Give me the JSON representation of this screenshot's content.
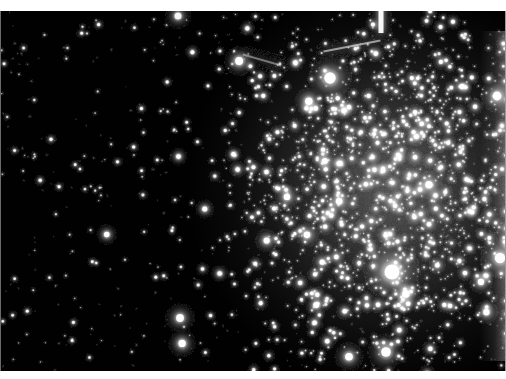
{
  "image": {
    "kind": "astronomical-photograph",
    "subject": "globular star cluster",
    "palette": "grayscale",
    "width": 506,
    "height": 379,
    "alt": "Grayscale astronomical image of a dense globular star cluster filling the right half of the frame against a sparse black star field on the left"
  },
  "frame": {
    "background_color": "#ffffff",
    "band_top_height": 11,
    "band_bottom_height": 8,
    "plate_top": 11,
    "plate_height": 360,
    "plate_background_color": "#010101",
    "edge_left_color": "#6a6a6a",
    "edge_right_color": "#9a9a9a"
  },
  "chart_data": {
    "type": "scatter",
    "title": "",
    "xlabel": "",
    "ylabel": "",
    "grid": false,
    "legend": null,
    "xlim": [
      0,
      506
    ],
    "ylim": [
      0,
      360
    ],
    "background": "#010101",
    "cluster": {
      "center_x": 392,
      "center_y": 176,
      "core_radius": 96,
      "halo_radius": 205,
      "peak_surface_brightness": 0.34,
      "edge_x_boundary": 258
    },
    "field_counts": {
      "sparse_field_stars": 560,
      "cluster_halo_stars": 620,
      "cluster_core_stars": 900,
      "bright_foreground_stars": 26
    },
    "bright_features": [
      {
        "name": "vertical-streak-top",
        "x": 381,
        "y": 16,
        "w": 5,
        "h": 34,
        "intensity": 0.95
      },
      {
        "name": "diagonal-trail-upper",
        "x": 352,
        "y": 46,
        "w": 58,
        "h": 2,
        "angle": -11,
        "intensity": 0.55
      },
      {
        "name": "diagonal-trail-mid",
        "x": 262,
        "y": 60,
        "w": 40,
        "h": 2,
        "angle": 16,
        "intensity": 0.4
      },
      {
        "name": "right-edge-glow",
        "x": 498,
        "y": 190,
        "w": 18,
        "h": 330,
        "intensity": 0.55
      },
      {
        "name": "bright-knot-core",
        "x": 392,
        "y": 272,
        "r": 17,
        "intensity": 1.0
      },
      {
        "name": "bright-knot-upper",
        "x": 330,
        "y": 78,
        "r": 13,
        "intensity": 0.95
      },
      {
        "name": "bright-star-left",
        "x": 180,
        "y": 318,
        "r": 9,
        "intensity": 0.85
      },
      {
        "name": "bright-star-topleft",
        "x": 178,
        "y": 16,
        "r": 8,
        "intensity": 0.8
      },
      {
        "name": "bright-star-rightedge",
        "x": 497,
        "y": 96,
        "r": 10,
        "intensity": 0.9
      },
      {
        "name": "bright-star-lower",
        "x": 386,
        "y": 352,
        "r": 11,
        "intensity": 0.9
      },
      {
        "name": "bright-star-far-right",
        "x": 500,
        "y": 258,
        "r": 12,
        "intensity": 0.85
      }
    ],
    "seed": 20241117
  }
}
